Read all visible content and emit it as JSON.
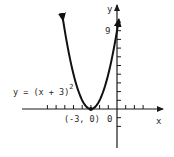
{
  "chart_data": {
    "type": "line",
    "title": "",
    "function": "y = (x + 3)^2",
    "equation_label": {
      "base": "y = (x + 3)",
      "exponent": "2"
    },
    "xlabel": "x",
    "ylabel": "y",
    "origin_label": "0",
    "y_tick_label": "9",
    "vertex": {
      "x": -3,
      "y": 0,
      "label": "(-3, 0)"
    },
    "series": [
      {
        "name": "y = (x + 3)^2",
        "x": [
          -6.2,
          -6,
          -5,
          -4,
          -3,
          -2,
          -1,
          0,
          0.2
        ],
        "y": [
          10.24,
          9,
          4,
          1,
          0,
          1,
          4,
          9,
          10.24
        ]
      }
    ],
    "xlim": [
      -10,
      5
    ],
    "ylim": [
      -4,
      11
    ],
    "x_ticks": [
      -8,
      -7,
      -6,
      -5,
      -4,
      -3,
      -2,
      -1,
      1,
      2,
      3
    ],
    "y_ticks": [
      -2,
      -1,
      1,
      2,
      3,
      4,
      5,
      6,
      7,
      8,
      9,
      10
    ],
    "grid": false,
    "legend": "none"
  },
  "colors": {
    "curve": "#111111",
    "axes": "#1a1a1a",
    "text": "#2a2a2a",
    "background": "#ffffff"
  }
}
